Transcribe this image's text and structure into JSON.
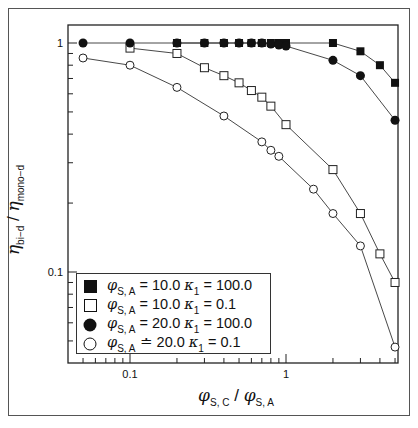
{
  "chart_data": {
    "type": "line",
    "xscale": "log",
    "yscale": "log",
    "title": "",
    "xlabel": "φ_S,C / φ_S,A",
    "ylabel": "η_bi-d / η_mono-d",
    "xlim": [
      0.04,
      5.2
    ],
    "ylim": [
      0.045,
      1.1
    ],
    "x_ticks": [
      "0.1",
      "1"
    ],
    "y_ticks": [
      "0.1",
      "1"
    ],
    "grid": false,
    "legend_position": "lower left",
    "series": [
      {
        "name": "φ_S,A = 10.0 κ1 = 100.0",
        "marker": "filled-square",
        "x": [
          0.2,
          0.3,
          0.4,
          0.5,
          0.6,
          0.7,
          0.8,
          0.9,
          1.0,
          2.0,
          3.0,
          4.0,
          5.0
        ],
        "y": [
          1.0,
          1.0,
          1.0,
          1.0,
          1.0,
          1.0,
          1.0,
          1.0,
          1.0,
          1.0,
          0.92,
          0.8,
          0.67
        ]
      },
      {
        "name": "φ_S,A = 10.0 κ1 = 0.1",
        "marker": "open-square",
        "x": [
          0.1,
          0.2,
          0.3,
          0.4,
          0.5,
          0.6,
          0.7,
          0.8,
          1.0,
          2.0,
          3.0,
          4.0,
          5.0
        ],
        "y": [
          0.95,
          0.9,
          0.78,
          0.72,
          0.67,
          0.62,
          0.58,
          0.53,
          0.44,
          0.28,
          0.18,
          0.12,
          0.09
        ]
      },
      {
        "name": "φ_S,A = 20.0 κ1 = 100.0",
        "marker": "filled-circle",
        "x": [
          0.05,
          0.1,
          0.2,
          0.3,
          0.4,
          0.5,
          0.6,
          0.7,
          0.8,
          0.9,
          1.0,
          2.0,
          3.0,
          5.0
        ],
        "y": [
          1.0,
          1.0,
          1.0,
          1.0,
          1.0,
          1.0,
          1.0,
          1.0,
          0.99,
          0.98,
          0.97,
          0.84,
          0.72,
          0.46
        ]
      },
      {
        "name": "φ_S,A = 20.0 κ1 = 0.1",
        "marker": "open-circle",
        "x": [
          0.05,
          0.1,
          0.2,
          0.4,
          0.7,
          0.8,
          0.9,
          1.5,
          2.0,
          3.0,
          5.0
        ],
        "y": [
          0.86,
          0.8,
          0.64,
          0.48,
          0.37,
          0.34,
          0.32,
          0.23,
          0.18,
          0.13,
          0.047
        ]
      }
    ]
  },
  "axes": {
    "y_tick_labels": [
      "1",
      "0.1"
    ],
    "x_tick_labels": [
      "0.1",
      "1"
    ],
    "x_title": {
      "main": "φ",
      "sub1": "S, C",
      "sep": " / ",
      "main2": "φ",
      "sub2": "S, A"
    },
    "y_title": {
      "main": "η",
      "sub1": "bi−d",
      "sep": " / ",
      "main2": "η",
      "sub2": "mono−d"
    }
  },
  "legend": {
    "items": [
      {
        "marker": "filled-square",
        "phi": "φ",
        "phi_sub": "S, A",
        "eq": " = 10.0 ",
        "kappa": "κ",
        "kappa_sub": "1",
        "val": " = 100.0"
      },
      {
        "marker": "open-square",
        "phi": "φ",
        "phi_sub": "S, A",
        "eq": " = 10.0 ",
        "kappa": "κ",
        "kappa_sub": "1",
        "val": " = 0.1"
      },
      {
        "marker": "filled-circle",
        "phi": "φ",
        "phi_sub": "S, A",
        "eq": " = 20.0 ",
        "kappa": "κ",
        "kappa_sub": "1",
        "val": " = 100.0"
      },
      {
        "marker": "open-circle",
        "phi": "φ",
        "phi_sub": "S, A",
        "eq": " ≐ 20.0 ",
        "kappa": "κ",
        "kappa_sub": "1",
        "val": " = 0.1"
      }
    ]
  },
  "colors": {
    "ink": "#111111",
    "line": "#333333",
    "background": "#ffffff"
  }
}
